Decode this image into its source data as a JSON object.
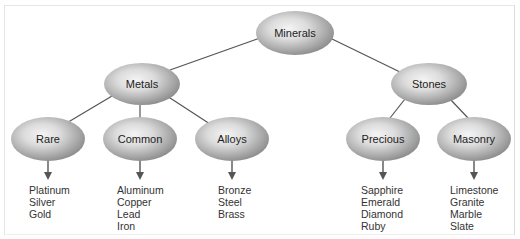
{
  "diagram": {
    "root": {
      "label": "Minerals"
    },
    "branches": [
      {
        "label": "Metals",
        "children": [
          {
            "label": "Rare",
            "items": [
              "Platinum",
              "Silver",
              "Gold"
            ]
          },
          {
            "label": "Common",
            "items": [
              "Aluminum",
              "Copper",
              "Lead",
              "Iron"
            ]
          },
          {
            "label": "Alloys",
            "items": [
              "Bronze",
              "Steel",
              "Brass"
            ]
          }
        ]
      },
      {
        "label": "Stones",
        "children": [
          {
            "label": "Precious",
            "items": [
              "Sapphire",
              "Emerald",
              "Diamond",
              "Ruby"
            ]
          },
          {
            "label": "Masonry",
            "items": [
              "Limestone",
              "Granite",
              "Marble",
              "Slate"
            ]
          }
        ]
      }
    ]
  }
}
